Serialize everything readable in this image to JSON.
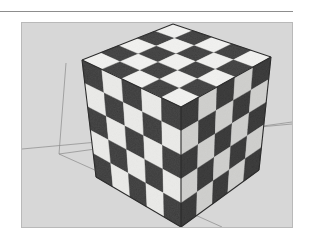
{
  "page": {
    "background_color": "#ffffff",
    "width": 313,
    "height": 245,
    "top_rule": {
      "name": "horizontal-rule",
      "color": "#8d8d8d"
    },
    "caption_text": ""
  },
  "viewport": {
    "name": "3d-viewport",
    "background_color": "#d7d7d7",
    "border_color": "#b9b9b9",
    "width": 272,
    "height": 206,
    "ground_line_color": "#8a8a8a",
    "vanishing_point": {
      "x": 37,
      "y": 131
    },
    "axis_lines": [
      {
        "name": "horizon-axis-line",
        "x1": 0,
        "y1": 126,
        "x2": 270,
        "y2": 101
      },
      {
        "name": "green-axis-line",
        "x1": 37,
        "y1": 131,
        "x2": 44,
        "y2": 40
      },
      {
        "name": "red-axis-line",
        "x1": 37,
        "y1": 131,
        "x2": 200,
        "y2": 204
      },
      {
        "name": "receding-edge-line",
        "x1": 37,
        "y1": 131,
        "x2": 270,
        "y2": 99
      }
    ]
  },
  "cube": {
    "name": "checkerboard-cube",
    "divisions": 5,
    "texture": "checkerboard",
    "light_color": "#f2f2f0",
    "dark_color": "#4a4a4a",
    "edge_color": "#2b2b2b",
    "face_shading": {
      "top": 1.0,
      "left": 0.97,
      "right": 0.86
    },
    "vertices": {
      "top_back": {
        "x": 151,
        "y": 1
      },
      "top_left": {
        "x": 60,
        "y": 37
      },
      "top_front": {
        "x": 159,
        "y": 84
      },
      "top_right": {
        "x": 249,
        "y": 34
      },
      "bottom_left": {
        "x": 74,
        "y": 154
      },
      "bottom_front": {
        "x": 159,
        "y": 204
      },
      "bottom_right": {
        "x": 237,
        "y": 147
      }
    }
  },
  "checker_start": {
    "top": 1,
    "left": 0,
    "right": 0
  }
}
